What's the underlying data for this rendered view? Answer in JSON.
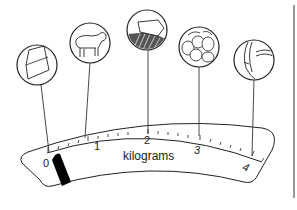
{
  "diagram": {
    "scale": {
      "unit_label": "kilograms",
      "tick_labels": [
        "0",
        "1",
        "2",
        "3",
        "4"
      ],
      "pointer_value": "0"
    },
    "items": [
      {
        "name": "cheese-wedge",
        "approx_weight_kg": "0"
      },
      {
        "name": "lamb",
        "approx_weight_kg": "0.8"
      },
      {
        "name": "bread-loaf",
        "approx_weight_kg": "2"
      },
      {
        "name": "potatoes",
        "approx_weight_kg": "3"
      },
      {
        "name": "bag",
        "approx_weight_kg": "4"
      }
    ],
    "colors": {
      "line": "#222222",
      "pointer": "#000000",
      "background": "#ffffff"
    }
  }
}
